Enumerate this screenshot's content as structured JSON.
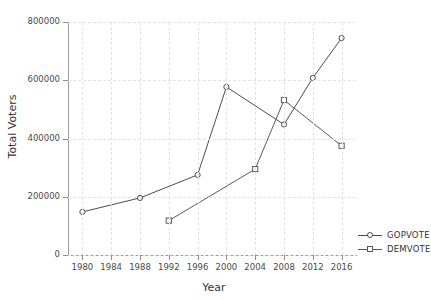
{
  "chart_data": {
    "type": "line",
    "title": "",
    "xlabel": "Year",
    "ylabel": "Total Voters",
    "x": [
      1980,
      1984,
      1988,
      1992,
      1996,
      2000,
      2004,
      2008,
      2012,
      2016
    ],
    "xtick_labels": [
      "1980",
      "1984",
      "1988",
      "1992",
      "1996",
      "2000",
      "2004",
      "2008",
      "2012",
      "2016"
    ],
    "ytick_labels": [
      "0",
      "200000",
      "400000",
      "600000",
      "800000"
    ],
    "yticks": [
      0,
      200000,
      400000,
      600000,
      800000
    ],
    "xlim": [
      1978,
      2018
    ],
    "ylim": [
      0,
      800000
    ],
    "grid": true,
    "legend_position": "right",
    "series": [
      {
        "name": "GOPVOTE",
        "marker": "circle",
        "color": "#4d4d4d",
        "points": [
          {
            "x": 1980,
            "y": 148000
          },
          {
            "x": 1988,
            "y": 196000
          },
          {
            "x": 1996,
            "y": 275000
          },
          {
            "x": 2000,
            "y": 577000
          },
          {
            "x": 2008,
            "y": 448000
          },
          {
            "x": 2012,
            "y": 608000
          },
          {
            "x": 2016,
            "y": 745000
          }
        ]
      },
      {
        "name": "DEMVOTE",
        "marker": "square",
        "color": "#5a5a5a",
        "points": [
          {
            "x": 1992,
            "y": 118000
          },
          {
            "x": 2004,
            "y": 295000
          },
          {
            "x": 2008,
            "y": 532000
          },
          {
            "x": 2016,
            "y": 375000
          }
        ]
      }
    ]
  },
  "legend": {
    "items": [
      {
        "label": "GOPVOTE"
      },
      {
        "label": "DEMVOTE"
      }
    ]
  }
}
